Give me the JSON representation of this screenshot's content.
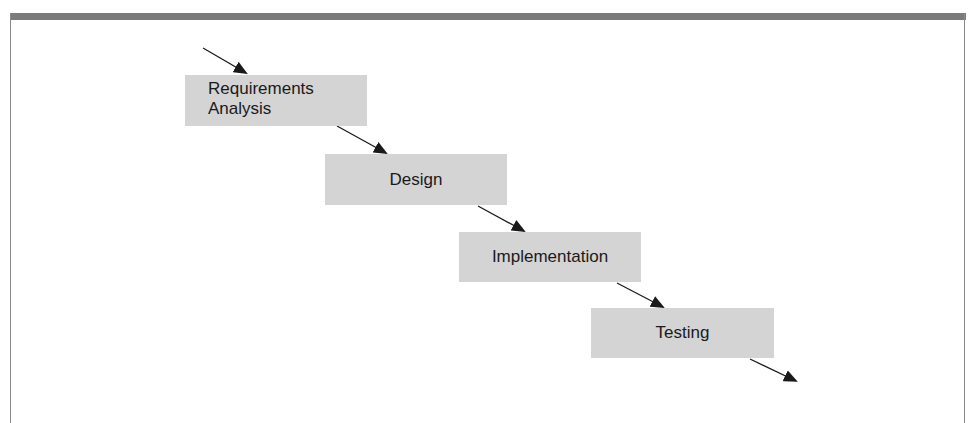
{
  "diagram": {
    "type": "waterfall-process",
    "stages": [
      {
        "id": "requirements",
        "lines": [
          "Requirements",
          "Analysis"
        ]
      },
      {
        "id": "design",
        "lines": [
          "Design"
        ]
      },
      {
        "id": "implementation",
        "lines": [
          "Implementation"
        ]
      },
      {
        "id": "testing",
        "lines": [
          "Testing"
        ]
      }
    ],
    "connectors": [
      {
        "from": "entry",
        "to": "requirements"
      },
      {
        "from": "requirements",
        "to": "design"
      },
      {
        "from": "design",
        "to": "implementation"
      },
      {
        "from": "implementation",
        "to": "testing"
      },
      {
        "from": "testing",
        "to": "exit"
      }
    ],
    "colors": {
      "box_fill": "#d4d4d4",
      "arrow": "#1a1a1a",
      "frame_band": "#7b7b7b"
    }
  }
}
